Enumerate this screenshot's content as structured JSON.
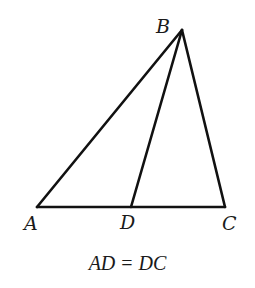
{
  "diagram": {
    "type": "triangle-with-median",
    "stroke_color": "#111111",
    "stroke_width": 2.6,
    "vertices": {
      "A": {
        "x": 37,
        "y": 207
      },
      "B": {
        "x": 182,
        "y": 30
      },
      "C": {
        "x": 225,
        "y": 207
      },
      "D": {
        "x": 131,
        "y": 207
      }
    },
    "segments": [
      {
        "from": "A",
        "to": "B"
      },
      {
        "from": "B",
        "to": "C"
      },
      {
        "from": "A",
        "to": "C"
      },
      {
        "from": "B",
        "to": "D"
      }
    ],
    "labels": {
      "A": "A",
      "B": "B",
      "C": "C",
      "D": "D"
    },
    "caption": {
      "left": "AD",
      "operator": "=",
      "right": "DC"
    }
  }
}
